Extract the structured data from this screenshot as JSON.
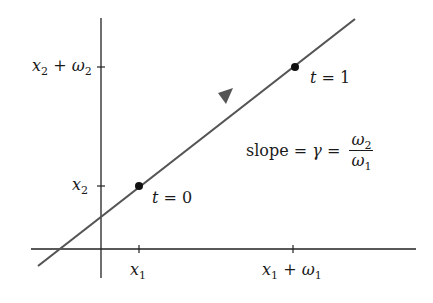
{
  "diagram": {
    "axes": {
      "x_ticks": [
        {
          "var": "x",
          "sub": "1",
          "op": "",
          "var2": "",
          "sub2": ""
        },
        {
          "var": "x",
          "sub": "1",
          "op": "+",
          "var2": "ω",
          "sub2": "1"
        }
      ],
      "y_ticks": [
        {
          "var": "x",
          "sub": "2",
          "op": "",
          "var2": "",
          "sub2": ""
        },
        {
          "var": "x",
          "sub": "2",
          "op": "+",
          "var2": "ω",
          "sub2": "2"
        }
      ]
    },
    "points": [
      {
        "label_var": "t",
        "label_eq": " = 0"
      },
      {
        "label_var": "t",
        "label_eq": " = 1"
      }
    ],
    "slope": {
      "word": "slope = ",
      "gamma": "γ",
      "eq": " = ",
      "num_var": "ω",
      "num_sub": "2",
      "den_var": "ω",
      "den_sub": "1"
    },
    "colors": {
      "line": "#555555",
      "axis": "#222222",
      "dot": "#111111"
    }
  }
}
